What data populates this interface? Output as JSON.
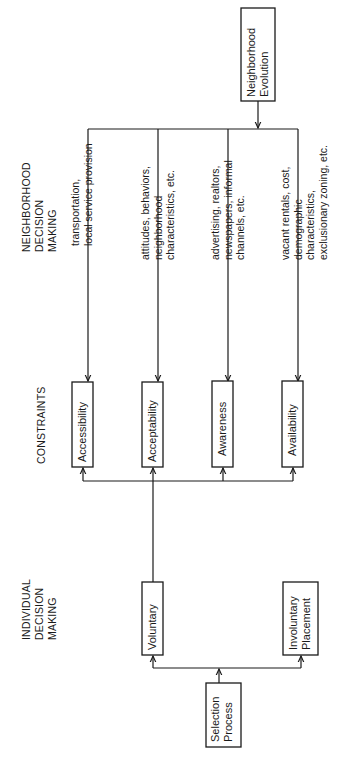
{
  "diagram": {
    "orientation": "rotated-90-ccw",
    "colors": {
      "ink": "#1a1a1a",
      "background": "#ffffff"
    },
    "headings": {
      "neighborhood": [
        "NEIGHBORHOOD",
        "DECISION",
        "MAKING"
      ],
      "constraints": [
        "CONSTRAINTS"
      ],
      "individual": [
        "INDIVIDUAL",
        "DECISION",
        "MAKING"
      ]
    },
    "nodes": {
      "neighborhood_evolution": [
        "Neighborhood",
        "Evolution"
      ],
      "accessibility": [
        "Accessibility"
      ],
      "acceptability": [
        "Acceptability"
      ],
      "awareness": [
        "Awareness"
      ],
      "availability": [
        "Availability"
      ],
      "voluntary": [
        "Voluntary"
      ],
      "involuntary_placement": [
        "Involuntary",
        "Placement"
      ],
      "selection_process": [
        "Selection",
        "Process"
      ]
    },
    "annotations": {
      "accessibility": [
        "transportation,",
        "local service provision"
      ],
      "acceptability": [
        "attitudes, behaviors,",
        "neighborhood",
        "characteristics, etc."
      ],
      "awareness": [
        "advertising, realtors,",
        "newspapers, informal",
        "channels, etc."
      ],
      "availability": [
        "vacant rentals, cost,",
        "demographic",
        "characteristics,",
        "exclusionary zoning, etc."
      ]
    },
    "edges": [
      {
        "from": "Neighborhood Evolution",
        "to": "Accessibility"
      },
      {
        "from": "Neighborhood Evolution",
        "to": "Acceptability"
      },
      {
        "from": "Neighborhood Evolution",
        "to": "Awareness"
      },
      {
        "from": "Neighborhood Evolution",
        "to": "Availability"
      },
      {
        "from": "Voluntary",
        "to": "Accessibility"
      },
      {
        "from": "Voluntary",
        "to": "Acceptability"
      },
      {
        "from": "Voluntary",
        "to": "Awareness"
      },
      {
        "from": "Voluntary",
        "to": "Availability"
      },
      {
        "from": "Selection Process",
        "to": "Voluntary"
      },
      {
        "from": "Selection Process",
        "to": "Involuntary Placement"
      }
    ]
  }
}
